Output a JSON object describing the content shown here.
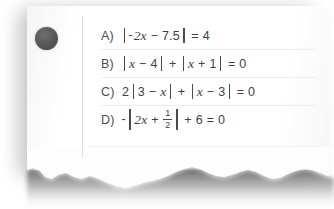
{
  "card": {
    "name": "torn-paper-answer-card",
    "paper_color": "#fdfdfd",
    "text_color": "#3f3f3f",
    "rule_color": "#ececec",
    "hole_punch_color": "#565656"
  },
  "choices": [
    {
      "label": "A)",
      "expression": "|-2x − 7.5| = 4",
      "parts": {
        "neg": "-",
        "coef_var": "2x",
        "op1": "−",
        "num1": "7.5",
        "equals": "=",
        "rhs": "4"
      }
    },
    {
      "label": "B)",
      "expression": "|x − 4| + |x + 1| = 0",
      "parts": {
        "var1": "x",
        "op1": "−",
        "num1": "4",
        "plus": "+",
        "var2": "x",
        "op2": "+",
        "num2": "1",
        "equals": "=",
        "rhs": "0"
      }
    },
    {
      "label": "C)",
      "expression": "2|3 − x| + |x − 3| = 0",
      "parts": {
        "coef": "2",
        "num1": "3",
        "op1": "−",
        "var1": "x",
        "plus": "+",
        "var2": "x",
        "op2": "−",
        "num2": "3",
        "equals": "=",
        "rhs": "0"
      }
    },
    {
      "label": "D)",
      "expression": "-|2x + 1/2| + 6 = 0",
      "parts": {
        "neg": "-",
        "coef_var": "2x",
        "op1": "+",
        "frac_numerator": "1",
        "frac_denominator": "2",
        "plus": "+",
        "num2": "6",
        "equals": "=",
        "rhs": "0"
      }
    }
  ]
}
